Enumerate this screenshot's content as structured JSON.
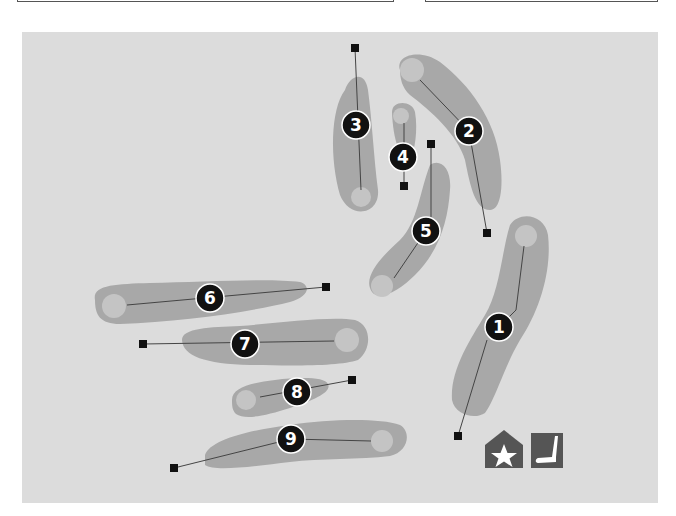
{
  "colors": {
    "background": "#dcdcdc",
    "fairway": "#a8a8a8",
    "green": "#c4c4c4",
    "marker": "#111111",
    "line": "#444444",
    "icon_fill": "#555555",
    "icon_glyph": "#ffffff"
  },
  "holes": [
    {
      "number": "1",
      "label_x": 499,
      "label_y": 327
    },
    {
      "number": "2",
      "label_x": 469,
      "label_y": 131
    },
    {
      "number": "3",
      "label_x": 356,
      "label_y": 125
    },
    {
      "number": "4",
      "label_x": 403,
      "label_y": 157
    },
    {
      "number": "5",
      "label_x": 426,
      "label_y": 231
    },
    {
      "number": "6",
      "label_x": 210,
      "label_y": 298
    },
    {
      "number": "7",
      "label_x": 245,
      "label_y": 344
    },
    {
      "number": "8",
      "label_x": 297,
      "label_y": 392
    },
    {
      "number": "9",
      "label_x": 291,
      "label_y": 439
    }
  ],
  "legend": {
    "clubhouse_icon": "star-clubhouse-icon",
    "putting_green_icon": "putter-icon"
  }
}
